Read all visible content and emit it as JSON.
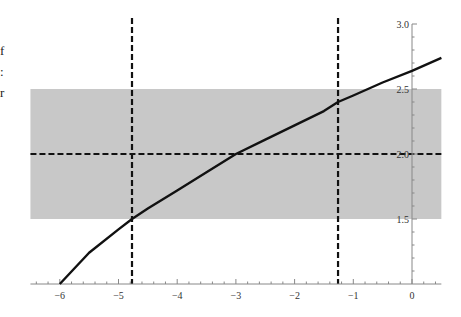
{
  "page": {
    "left_text_fragments": [
      "f",
      ":",
      "r"
    ]
  },
  "chart_data": {
    "type": "line",
    "title": "",
    "xlabel": "",
    "ylabel": "",
    "xlim": [
      -6.5,
      0.5
    ],
    "ylim": [
      1.0,
      3.0
    ],
    "grid": false,
    "legend": null,
    "x_ticks": [
      -6,
      -5,
      -4,
      -3,
      -2,
      -1,
      0
    ],
    "x_tick_labels": [
      "−6",
      "−5",
      "−4",
      "−3",
      "−2",
      "−1",
      "0"
    ],
    "y_ticks": [
      1.5,
      2.0,
      2.5,
      3.0
    ],
    "y_tick_labels": [
      "1.5",
      "2.0",
      "2.5",
      "3.0"
    ],
    "y_axis_at_x": 0,
    "series": [
      {
        "name": "curve",
        "style": "solid",
        "color": "#111111",
        "x": [
          -6.0,
          -5.5,
          -5.0,
          -4.77,
          -4.5,
          -4.0,
          -3.5,
          -3.0,
          -2.5,
          -2.0,
          -1.5,
          -1.26,
          -1.0,
          -0.5,
          0.0,
          0.5
        ],
        "y": [
          1.0,
          1.24,
          1.42,
          1.5,
          1.58,
          1.72,
          1.86,
          2.0,
          2.11,
          2.22,
          2.33,
          2.4,
          2.45,
          2.55,
          2.64,
          2.74
        ]
      }
    ],
    "reference_lines": {
      "horizontal": [
        {
          "y": 2.0,
          "style": "dashed",
          "color": "#111111"
        }
      ],
      "vertical": [
        {
          "x": -4.77,
          "style": "dashed",
          "color": "#111111"
        },
        {
          "x": -1.26,
          "style": "dashed",
          "color": "#111111"
        }
      ]
    },
    "shaded_band": {
      "y_min": 1.5,
      "y_max": 2.5,
      "color": "#c8c8c8"
    },
    "annotations": []
  }
}
